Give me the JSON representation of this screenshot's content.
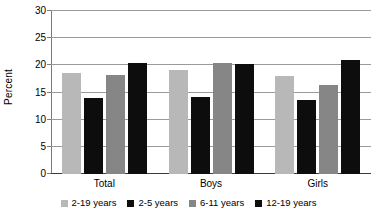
{
  "chart_data": {
    "type": "bar",
    "title": "",
    "xlabel": "",
    "ylabel": "Percent",
    "ylim": [
      0,
      30
    ],
    "yticks": [
      0,
      5,
      10,
      15,
      20,
      25,
      30
    ],
    "ytick_labels": [
      "0",
      "5",
      "10",
      "15",
      "20",
      "25",
      "30"
    ],
    "grid": true,
    "legend_position": "bottom",
    "categories": [
      "Total",
      "Boys",
      "Girls"
    ],
    "series": [
      {
        "name": "2-19 years",
        "color": "#b8b8b8",
        "values": [
          18.5,
          19.1,
          18.0
        ]
      },
      {
        "name": "2-5 years",
        "color": "#0d0d0d",
        "values": [
          13.9,
          14.2,
          13.6
        ]
      },
      {
        "name": "6-11 years",
        "color": "#868686",
        "values": [
          18.3,
          20.4,
          16.3
        ]
      },
      {
        "name": "12-19 years",
        "color": "#0d0d0d",
        "values": [
          20.5,
          20.2,
          20.9
        ]
      }
    ]
  }
}
